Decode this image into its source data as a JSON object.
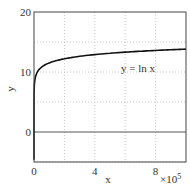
{
  "chart_data": {
    "type": "line",
    "title": "",
    "xlabel": "x",
    "ylabel": "y",
    "x_multiplier_label": "×10",
    "x_multiplier_exp": "5",
    "xlim": [
      0,
      1000000
    ],
    "ylim": [
      -5,
      20
    ],
    "xticks": [
      0,
      4,
      8
    ],
    "xtick_labels": [
      "0",
      "4",
      "8"
    ],
    "yticks": [
      0,
      10,
      20
    ],
    "ytick_labels": [
      "0",
      "10",
      "20"
    ],
    "x_grid": [
      2,
      4,
      6,
      8
    ],
    "y_grid": [
      -5,
      5,
      10,
      15
    ],
    "grid": true,
    "zero_line": true,
    "series": [
      {
        "name": "y = ln x",
        "function": "ln(x)",
        "x": [
          1,
          10,
          100,
          1000,
          10000,
          50000,
          100000,
          200000,
          400000,
          600000,
          800000,
          1000000
        ],
        "values": [
          0,
          2.3,
          4.6,
          6.9,
          9.2,
          10.8,
          11.5,
          12.2,
          12.9,
          13.3,
          13.6,
          13.8
        ]
      }
    ],
    "annotations": [
      {
        "text": "y = ln x",
        "x": 6.8,
        "y": 10.7
      }
    ],
    "colors": {
      "line": "#111111",
      "axis": "#444444",
      "grid": "#bbbbbb",
      "zero_line": "#555555"
    }
  }
}
